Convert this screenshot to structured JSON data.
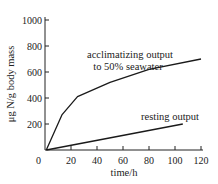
{
  "chart_data": {
    "type": "line",
    "title": "",
    "xlabel": "time/h",
    "ylabel": "μg N/g body mass",
    "xlim": [
      0,
      120
    ],
    "ylim": [
      0,
      1000
    ],
    "xticks": [
      0,
      20,
      40,
      60,
      80,
      100,
      120
    ],
    "yticks": [
      0,
      200,
      400,
      600,
      800,
      1000
    ],
    "xtick_labels": [
      "0",
      "20",
      "40",
      "60",
      "80",
      "100",
      "120"
    ],
    "ytick_labels": [
      "0",
      "200",
      "400",
      "600",
      "800",
      "1000"
    ],
    "grid": false,
    "legend": "none (inline annotations)",
    "series": [
      {
        "name": "acclimatizing output to 50% seawater",
        "annotation_lines": [
          "acclimatizing output",
          "to 50% seawater"
        ],
        "x": [
          1,
          13,
          25,
          50,
          80,
          120
        ],
        "y": [
          0,
          270,
          410,
          520,
          620,
          700
        ]
      },
      {
        "name": "resting output",
        "annotation_lines": [
          "resting output"
        ],
        "x": [
          1,
          106
        ],
        "y": [
          0,
          200
        ]
      }
    ]
  }
}
